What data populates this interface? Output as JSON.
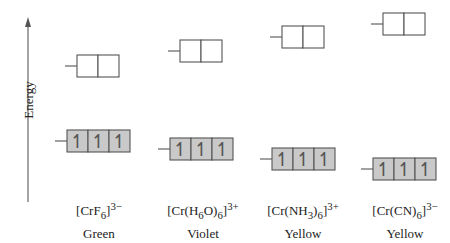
{
  "axis": {
    "label": "Energy",
    "direction": "up"
  },
  "colors": {
    "line": "#555555",
    "t2g_fill": "#c9c9c9",
    "eg_fill": "#ffffff",
    "axis": "#666666",
    "text": "#222222"
  },
  "electron_symbol": "↿",
  "complexes": [
    {
      "formula_main": "[CrF",
      "formula_sub": "6",
      "formula_close": "]",
      "charge": "3−",
      "observed_color": "Green",
      "eg": {
        "x": 77,
        "y": 55,
        "orbitals": 2,
        "electrons": 0
      },
      "t2g": {
        "x": 67,
        "y": 130,
        "orbitals": 3,
        "electrons": 3
      }
    },
    {
      "formula_main": "[Cr(H",
      "formula_sub": "6",
      "formula_mid": "O)",
      "formula_sub2": "6",
      "formula_close": "]",
      "charge": "3+",
      "observed_color": "Violet",
      "eg": {
        "x": 180,
        "y": 40,
        "orbitals": 2,
        "electrons": 0
      },
      "t2g": {
        "x": 170,
        "y": 138,
        "orbitals": 3,
        "electrons": 3
      }
    },
    {
      "formula_main": "[Cr(NH",
      "formula_sub": "3",
      "formula_mid": ")",
      "formula_sub2": "6",
      "formula_close": "]",
      "charge": "3+",
      "observed_color": "Yellow",
      "eg": {
        "x": 282,
        "y": 26,
        "orbitals": 2,
        "electrons": 0
      },
      "t2g": {
        "x": 272,
        "y": 148,
        "orbitals": 3,
        "electrons": 3
      }
    },
    {
      "formula_main": "[Cr(CN)",
      "formula_sub": "6",
      "formula_close": "]",
      "charge": "3−",
      "observed_color": "Yellow",
      "eg": {
        "x": 383,
        "y": 13,
        "orbitals": 2,
        "electrons": 0
      },
      "t2g": {
        "x": 373,
        "y": 158,
        "orbitals": 3,
        "electrons": 3
      }
    }
  ]
}
